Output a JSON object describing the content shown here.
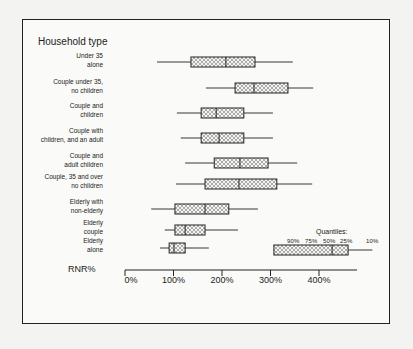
{
  "chart_data": {
    "type": "boxplot",
    "title": "Household type",
    "xlabel": "RNR%",
    "xlim": [
      0,
      470
    ],
    "xticks": [
      "0%",
      "100%",
      "200%",
      "300%",
      "400%"
    ],
    "tick_values": [
      0,
      100,
      200,
      300,
      400
    ],
    "legend": {
      "title": "Quantiles:",
      "labels": [
        "90%",
        "75%",
        "50%",
        "25%",
        "10%"
      ]
    },
    "categories": [
      "Under 35\nalone",
      "Couple under 35,\nno children",
      "Couple and\nchildren",
      "Couple with\nchildren, and an adult",
      "Couple and\nadult children",
      "Couple, 35 and over\nno children",
      "Elderly with\nnon-elderly",
      "Elderly\ncouple",
      "Elderly\nalone"
    ],
    "series": [
      {
        "name": "Under 35 alone",
        "p10": 66,
        "p25": 136,
        "p50": 208,
        "p75": 268,
        "p90": 346
      },
      {
        "name": "Couple under 35, no children",
        "p10": 167,
        "p25": 227,
        "p50": 266,
        "p75": 336,
        "p90": 388
      },
      {
        "name": "Couple and children",
        "p10": 107,
        "p25": 157,
        "p50": 188,
        "p75": 245,
        "p90": 305
      },
      {
        "name": "Couple with children, and an adult",
        "p10": 115,
        "p25": 157,
        "p50": 194,
        "p75": 245,
        "p90": 305
      },
      {
        "name": "Couple and adult children",
        "p10": 124,
        "p25": 184,
        "p50": 237,
        "p75": 295,
        "p90": 355
      },
      {
        "name": "Couple, 35 and over no children",
        "p10": 105,
        "p25": 165,
        "p50": 235,
        "p75": 313,
        "p90": 386
      },
      {
        "name": "Elderly with non-elderly",
        "p10": 54,
        "p25": 103,
        "p50": 165,
        "p75": 214,
        "p90": 274
      },
      {
        "name": "Elderly couple",
        "p10": 82,
        "p25": 103,
        "p50": 124,
        "p75": 165,
        "p90": 233
      },
      {
        "name": "Elderly alone",
        "p10": 72,
        "p25": 91,
        "p50": 101,
        "p75": 124,
        "p90": 173
      }
    ],
    "grid": false
  },
  "layout": {
    "x0": 125,
    "px_per_unit": 0.485,
    "row_y": [
      62,
      88,
      113,
      138,
      163,
      184,
      209,
      230,
      248
    ],
    "label_top": [
      52,
      78,
      102,
      127,
      152,
      173,
      198,
      219,
      237
    ],
    "legend_y": 250,
    "legend_values": {
      "p10": 341,
      "p25": 307,
      "p50": 427,
      "p75": 460,
      "p90": 510
    }
  }
}
